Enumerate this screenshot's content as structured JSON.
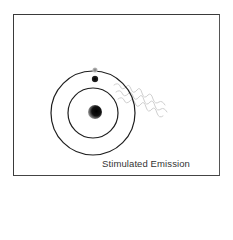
{
  "diagram": {
    "caption": "Stimulated Emission",
    "elements": {
      "nucleus": {
        "cx": 95,
        "cy": 112,
        "r": 7,
        "color": "#111111"
      },
      "inner_orbit": {
        "cx": 93,
        "cy": 113,
        "r": 25
      },
      "outer_orbit": {
        "cx": 93,
        "cy": 113,
        "r": 42
      },
      "electron": {
        "cx": 95,
        "cy": 79,
        "r": 3.2,
        "color": "#1a1a1a"
      },
      "faded_electron": {
        "cx": 95,
        "cy": 70,
        "r": 2.6,
        "color": "#888888"
      },
      "photon_wave": {
        "color": "#c8c8c8"
      }
    }
  }
}
